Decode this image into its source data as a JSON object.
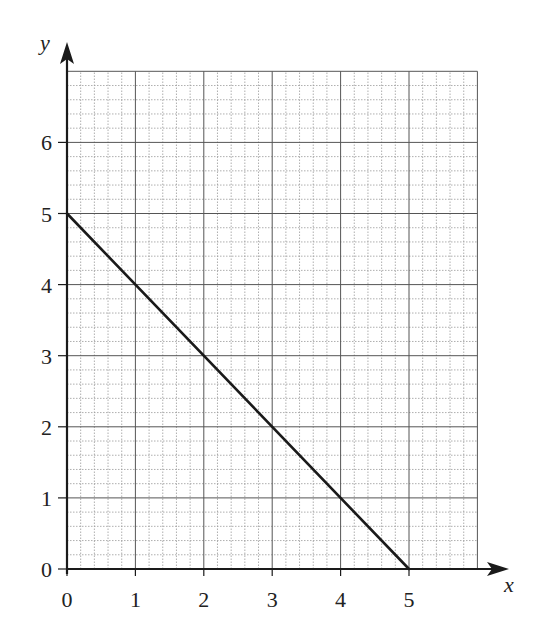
{
  "chart_data": {
    "type": "line",
    "title": "",
    "xlabel": "x",
    "ylabel": "y",
    "xlim": [
      0,
      6
    ],
    "ylim": [
      0,
      7
    ],
    "x_ticks": [
      0,
      1,
      2,
      3,
      4,
      5
    ],
    "y_ticks": [
      0,
      1,
      2,
      3,
      4,
      5,
      6
    ],
    "grid": true,
    "minor_grid_per_unit": 5,
    "legend": null,
    "series": [
      {
        "name": "line",
        "x": [
          0,
          5
        ],
        "y": [
          5,
          0
        ],
        "color": "#1a1a1a"
      }
    ]
  },
  "colors": {
    "axis": "#1a1a1a",
    "major_grid": "#555555",
    "minor_grid": "#9a9a9a",
    "line": "#1a1a1a"
  }
}
